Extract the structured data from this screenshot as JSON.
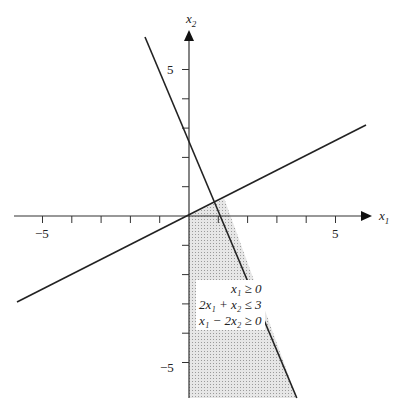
{
  "axes": {
    "x_label": "x",
    "x_sub": "1",
    "y_label": "x",
    "y_sub": "2",
    "x_ticks": [
      "−5",
      "5"
    ],
    "y_ticks": [
      "5",
      "−5"
    ]
  },
  "region": {
    "constraints": [
      {
        "text": "x₁ ≥ 0"
      },
      {
        "text": "2x₁ + x₂ ≤ 3"
      },
      {
        "text": "x₁ − 2x₂ ≥ 0"
      }
    ],
    "fill": "#d9d9d9"
  },
  "lines": [
    {
      "equation": "2x1 + x2 = 3"
    },
    {
      "equation": "x1 - 2x2 = 0"
    }
  ]
}
